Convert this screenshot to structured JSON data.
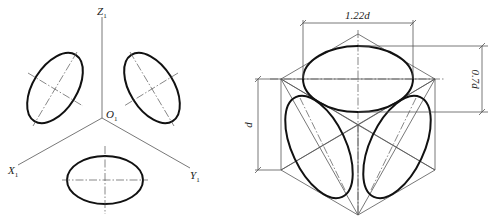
{
  "left_figure": {
    "axes": {
      "z": "Z",
      "x": "X",
      "y": "Y",
      "origin": "O",
      "subscript": "1"
    }
  },
  "right_figure": {
    "dimensions": {
      "top_width": "1.22d",
      "right_height": "0.7d",
      "left_height": "d"
    }
  }
}
